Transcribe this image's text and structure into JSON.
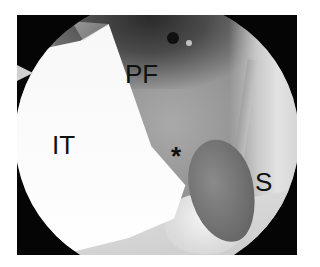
{
  "figure": {
    "type": "endoscopic-photograph",
    "colors": {
      "frame": "#050505",
      "background": "#ffffff",
      "label": "#111111"
    },
    "labels": {
      "pf": "PF",
      "it": "IT",
      "asterisk": "*",
      "s": "S"
    }
  }
}
